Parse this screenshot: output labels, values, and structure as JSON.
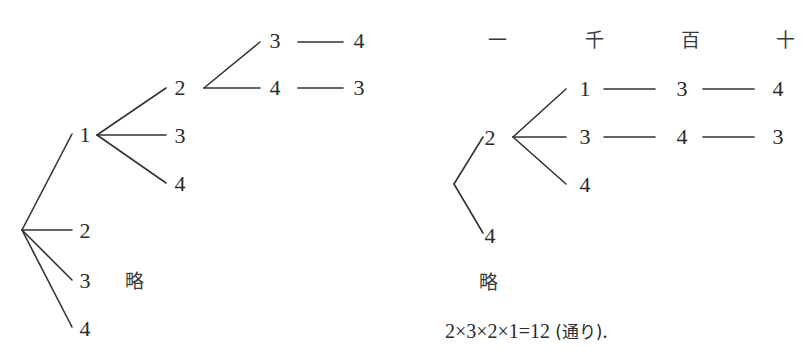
{
  "left_tree": {
    "root": {
      "children": [
        "1",
        "2",
        "3",
        "4"
      ]
    },
    "level1": {
      "node": "1",
      "children": [
        "2",
        "3",
        "4"
      ]
    },
    "level2": {
      "node": "2",
      "children": [
        "3",
        "4"
      ]
    },
    "level3": [
      {
        "from": "3",
        "to": "4"
      },
      {
        "from": "4",
        "to": "3"
      }
    ],
    "labels": {
      "r1": "1",
      "r2": "2",
      "r3": "3",
      "r4": "4",
      "a2": "2",
      "a3": "3",
      "a4": "4",
      "b3": "3",
      "b4": "4",
      "c4": "4",
      "c3": "3"
    },
    "omitted": "略"
  },
  "right_tree": {
    "headers": [
      "一",
      "千",
      "百",
      "十"
    ],
    "labels": {
      "r2": "2",
      "r4": "4",
      "a1": "1",
      "a3": "3",
      "a4": "4",
      "row1_h": "3",
      "row1_t": "4",
      "row2_h": "4",
      "row2_t": "3"
    },
    "omitted": "略"
  },
  "formula": {
    "expression": "2×3×2×1=12",
    "unit": "(通り)",
    "end": "."
  }
}
